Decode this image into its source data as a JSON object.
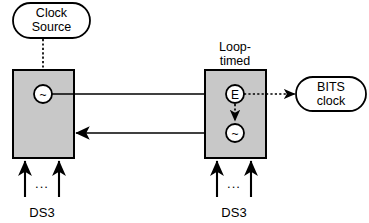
{
  "diagram": {
    "colors": {
      "block_fill": "#c8c8c8",
      "stroke": "#000000",
      "background": "#ffffff"
    },
    "nodes": {
      "clock_source": {
        "label_line1": "Clock",
        "label_line2": "Source",
        "shape": "rounded-rectangle"
      },
      "bits_clock": {
        "label_line1": "BITS",
        "label_line2": "clock",
        "shape": "rounded-rectangle"
      },
      "left_block": {
        "caption": "",
        "oscillator_symbol": "~"
      },
      "right_block": {
        "caption_line1": "Loop-",
        "caption_line2": "timed",
        "extract_symbol": "E",
        "oscillator_symbol": "~"
      }
    },
    "signals": {
      "left_input_label": "DS3",
      "right_input_label": "DS3",
      "ellipsis": "..."
    },
    "connections": [
      {
        "from": "clock-source",
        "to": "left-oscillator",
        "style": "dotted"
      },
      {
        "from": "left-oscillator",
        "to": "right-extract",
        "style": "solid"
      },
      {
        "from": "right-extract",
        "to": "bits-clock",
        "style": "dotted"
      },
      {
        "from": "right-extract",
        "to": "right-oscillator",
        "style": "dotted"
      },
      {
        "from": "right-oscillator",
        "to": "left-block",
        "style": "solid"
      }
    ]
  }
}
